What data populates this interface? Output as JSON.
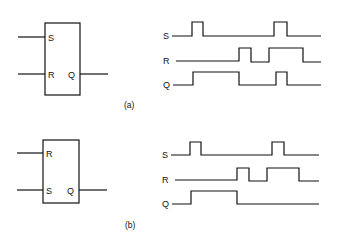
{
  "figure": {
    "panels": [
      {
        "caption": "(a)",
        "block": {
          "inputs": [
            "S",
            "R"
          ],
          "output": "Q"
        },
        "waveforms": {
          "labels": [
            "S",
            "R",
            "Q"
          ],
          "S": "pulse at t1, pulse at t4",
          "R": "pulse at t2, long pulse t3-t5",
          "Q": "high t1-t2, pulse t4"
        }
      },
      {
        "caption": "(b)",
        "block": {
          "inputs": [
            "R",
            "S"
          ],
          "output": "Q"
        },
        "waveforms": {
          "labels": [
            "S",
            "R",
            "Q"
          ],
          "S": "pulse at t1, pulse at t4",
          "R": "pulse at t2, long pulse t3-t5",
          "Q": "high t1-t2, then low"
        }
      }
    ]
  }
}
